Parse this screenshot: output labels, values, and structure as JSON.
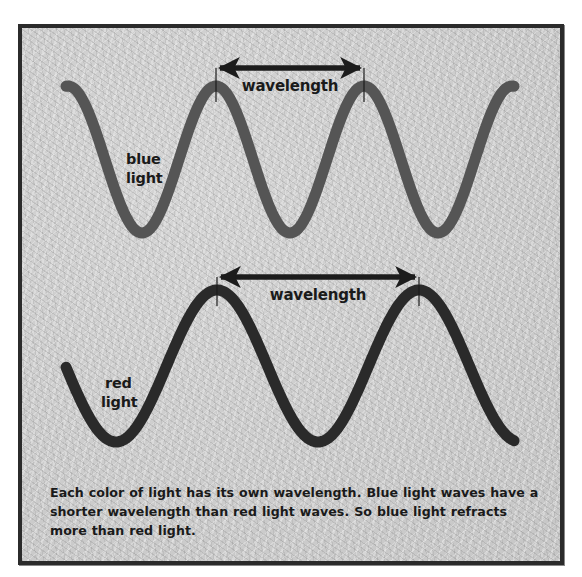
{
  "diagram": {
    "colors": {
      "frame_border": "#2b2b2b",
      "background": "#cdcdcd",
      "blue_wave_stroke": "#555555",
      "red_wave_stroke": "#2a2a2a",
      "arrow": "#1c1c1c",
      "text": "#1a1a1a"
    },
    "blue_wave": {
      "label_line1": "blue",
      "label_line2": "light",
      "wavelength_label": "wavelength",
      "wavelength_px": 148,
      "amplitude_px": 73.5,
      "center_y": 159.5,
      "start_x": 66,
      "end_x": 514,
      "peak_x": 216,
      "arrow": {
        "x1": 216,
        "x2": 364,
        "y": 68
      }
    },
    "red_wave": {
      "label_line1": "red",
      "label_line2": "light",
      "wavelength_label": "wavelength",
      "wavelength_px": 202,
      "amplitude_px": 76,
      "center_y": 366,
      "start_x": 66,
      "end_x": 515,
      "peak_x": 217,
      "arrow": {
        "x1": 217,
        "x2": 419,
        "y": 277
      }
    },
    "caption": "Each color of light has its own wavelength.  Blue light waves have a shorter wavelength than red light waves. So blue light refracts more than red light."
  }
}
